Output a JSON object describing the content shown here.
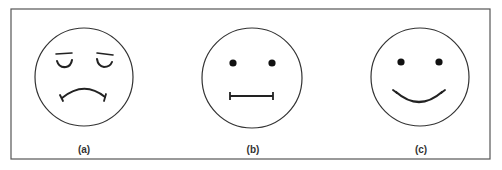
{
  "figure": {
    "frame": {
      "x": 11,
      "y": 9,
      "width": 479,
      "height": 150,
      "stroke": "#555555"
    },
    "stroke_color": "#222222",
    "panels": [
      {
        "id": "a",
        "label": "(a)",
        "expression": "sad",
        "face": {
          "cx": 84,
          "cy": 77,
          "r": 49
        },
        "eyes": "closed-droopy",
        "mouth": "frown"
      },
      {
        "id": "b",
        "label": "(b)",
        "expression": "neutral",
        "face": {
          "cx": 252,
          "cy": 78,
          "r": 50
        },
        "eyes": "dots",
        "mouth": "straight-line"
      },
      {
        "id": "c",
        "label": "(c)",
        "expression": "happy",
        "face": {
          "cx": 420,
          "cy": 77,
          "r": 49
        },
        "eyes": "dots",
        "mouth": "smile"
      }
    ]
  }
}
